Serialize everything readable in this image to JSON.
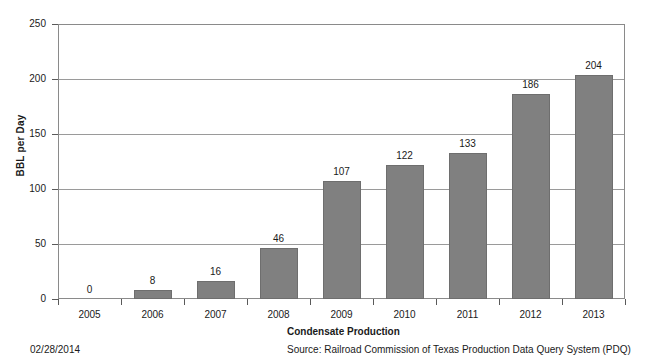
{
  "chart_data": {
    "type": "bar",
    "title": "Condensate Production",
    "xlabel": "",
    "ylabel": "BBL per Day",
    "categories": [
      "2005",
      "2006",
      "2007",
      "2008",
      "2009",
      "2010",
      "2011",
      "2012",
      "2013"
    ],
    "values": [
      0,
      8,
      16,
      46,
      107,
      122,
      133,
      186,
      204
    ],
    "data_labels": [
      "0",
      "8",
      "16",
      "46",
      "107",
      "122",
      "133",
      "186",
      "204"
    ],
    "ylim": [
      0,
      250
    ],
    "yticks": [
      0,
      50,
      100,
      150,
      200,
      250
    ],
    "ytick_labels": [
      "0",
      "50",
      "100",
      "150",
      "200",
      "250"
    ],
    "grid": true,
    "legend": false,
    "bar_color": "#808080",
    "bar_border_color": "#6e6e6e",
    "axis_color": "#8a8a8a",
    "gridline_color": "#9a9a9a",
    "background_color": "#ffffff"
  },
  "footer": {
    "date_stamp": "02/28/2014",
    "caption": "Condensate Production",
    "source": "Source: Railroad Commission of Texas Production Data Query System (PDQ)"
  }
}
